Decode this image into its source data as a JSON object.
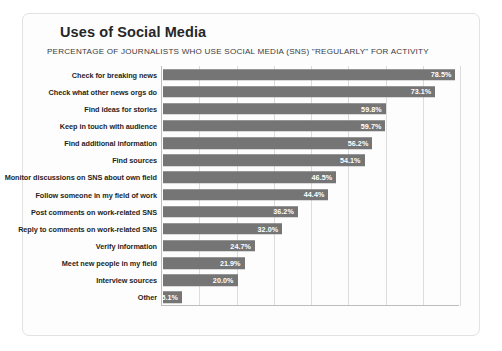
{
  "chart_data": {
    "type": "bar",
    "orientation": "horizontal",
    "title": "Uses of Social Media",
    "subtitle": "PERCENTAGE OF JOURNALISTS WHO USE SOCIAL MEDIA (SNS) \"REGULARLY\" FOR ACTIVITY",
    "xlabel": "",
    "ylabel": "",
    "xlim": [
      0,
      80
    ],
    "grid": true,
    "legend": false,
    "bar_color": "#757575",
    "value_label_color": "#ffffff",
    "categories": [
      "Check for breaking news",
      "Check what other news orgs do",
      "Find ideas for stories",
      "Keep in touch with audience",
      "Find additional information",
      "Find sources",
      "Monitor discussions on SNS about own field",
      "Follow someone in my field of work",
      "Post comments on work-related SNS",
      "Reply to comments on work-related SNS",
      "Verify information",
      "Meet new people in my field",
      "Interview sources",
      "Other"
    ],
    "values": [
      78.5,
      73.1,
      59.8,
      59.7,
      56.2,
      54.1,
      46.5,
      44.4,
      36.2,
      32.0,
      24.7,
      21.9,
      20.0,
      5.1
    ],
    "value_labels": [
      "78.5%",
      "73.1%",
      "59.8%",
      "59.7%",
      "56.2%",
      "54.1%",
      "46.5%",
      "44.4%",
      "36.2%",
      "32.0%",
      "24.7%",
      "21.9%",
      "20.0%",
      "5.1%"
    ],
    "xticks": [
      0,
      10,
      20,
      30,
      40,
      50,
      60,
      70,
      80
    ],
    "xtick_labels": [
      "0%",
      "10%",
      "20%",
      "30%",
      "40%",
      "50%",
      "60%",
      "70%",
      "80%"
    ]
  }
}
